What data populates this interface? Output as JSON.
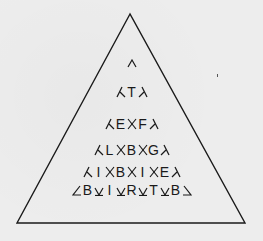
{
  "puzzle": {
    "shape": "triangle",
    "line_color": "#1a1a1a",
    "background_color": "#ececec",
    "apex_symbol": "^",
    "rows": [
      {
        "letters": [
          "T"
        ]
      },
      {
        "letters": [
          "E",
          "F"
        ]
      },
      {
        "letters": [
          "L",
          "B",
          "G"
        ]
      },
      {
        "letters": [
          "I",
          "B",
          "I",
          "E"
        ]
      },
      {
        "letters": [
          "B",
          "I",
          "R",
          "T",
          "B"
        ]
      }
    ],
    "letter_sequence": "T EF LBG IBIE BIRTB"
  }
}
